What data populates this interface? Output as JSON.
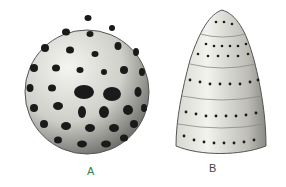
{
  "figure": {
    "panels": [
      {
        "label": "A",
        "subject": "spherical perforated radiolarian shell"
      },
      {
        "label": "B",
        "subject": "conical segmented perforated radiolarian shell"
      }
    ]
  },
  "colors": {
    "background": "#ffffff",
    "shell_light": "#e8e8e4",
    "shell_shadow": "#6a6a66",
    "pores": "#1a1a1a",
    "label_a": "#3f7a4a",
    "label_b": "#444444"
  }
}
